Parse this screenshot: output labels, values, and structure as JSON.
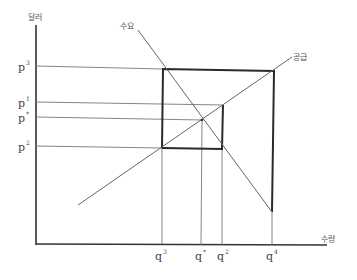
{
  "diagram": {
    "type": "supply-demand",
    "axes": {
      "y_label": "달러",
      "x_label": "수량"
    },
    "curves": {
      "demand_label": "수요",
      "supply_label": "공급"
    },
    "price_levels": [
      {
        "base": "p",
        "sup": "3",
        "name": "p3"
      },
      {
        "base": "p",
        "sup": "1",
        "name": "p1"
      },
      {
        "base": "p",
        "sup": "*",
        "name": "p-star"
      },
      {
        "base": "p",
        "sup": "2",
        "name": "p2"
      }
    ],
    "quantity_levels": [
      {
        "base": "q",
        "sup": "3",
        "name": "q3"
      },
      {
        "base": "q",
        "sup": "*",
        "name": "q-star"
      },
      {
        "base": "q",
        "sup": "2",
        "name": "q2"
      },
      {
        "base": "q",
        "sup": "4",
        "name": "q4"
      }
    ],
    "colors": {
      "axis": "#333333",
      "thin_line": "#777777",
      "box": "#2a2a2a",
      "curve": "#666666"
    }
  }
}
